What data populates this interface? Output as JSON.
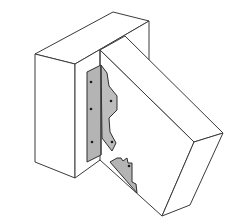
{
  "figure": {
    "colors": {
      "background": "#ffffff",
      "line": "#3a3a3a",
      "steel": "#b4b4b4",
      "nail": "#1a1a1a"
    },
    "parts": [
      {
        "id": "header-block",
        "label": "header"
      },
      {
        "id": "joist",
        "label": "skewed joist"
      },
      {
        "id": "hanger-upper",
        "label": "hanger flange (upper)"
      },
      {
        "id": "hanger-lower",
        "label": "hanger seat (lower)"
      }
    ],
    "nail_count": 6
  }
}
